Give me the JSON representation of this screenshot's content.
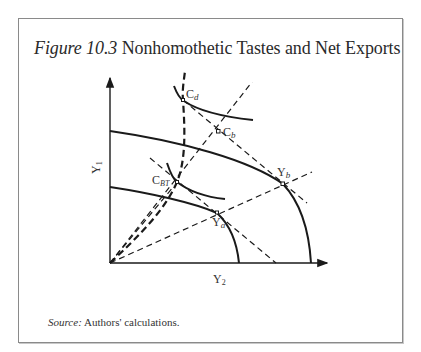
{
  "figure": {
    "label": "Figure 10.3",
    "title": "Nonhomothetic Tastes and Net Exports"
  },
  "axes": {
    "y_label": "Y",
    "y_sub": "1",
    "x_label": "Y",
    "x_sub": "2"
  },
  "points": {
    "Cd": {
      "main": "C",
      "sub": "d"
    },
    "Cb": {
      "main": "C",
      "sub": "b"
    },
    "CBT": {
      "main": "C",
      "sub": "BT"
    },
    "Yb": {
      "main": "Y",
      "sub": "b"
    },
    "Ya": {
      "main": "Y",
      "sub": "a"
    }
  },
  "source": {
    "label": "Source:",
    "text": "Authors' calculations."
  },
  "colors": {
    "ink": "#1a1a1a",
    "frame": "#8a8a8a"
  }
}
